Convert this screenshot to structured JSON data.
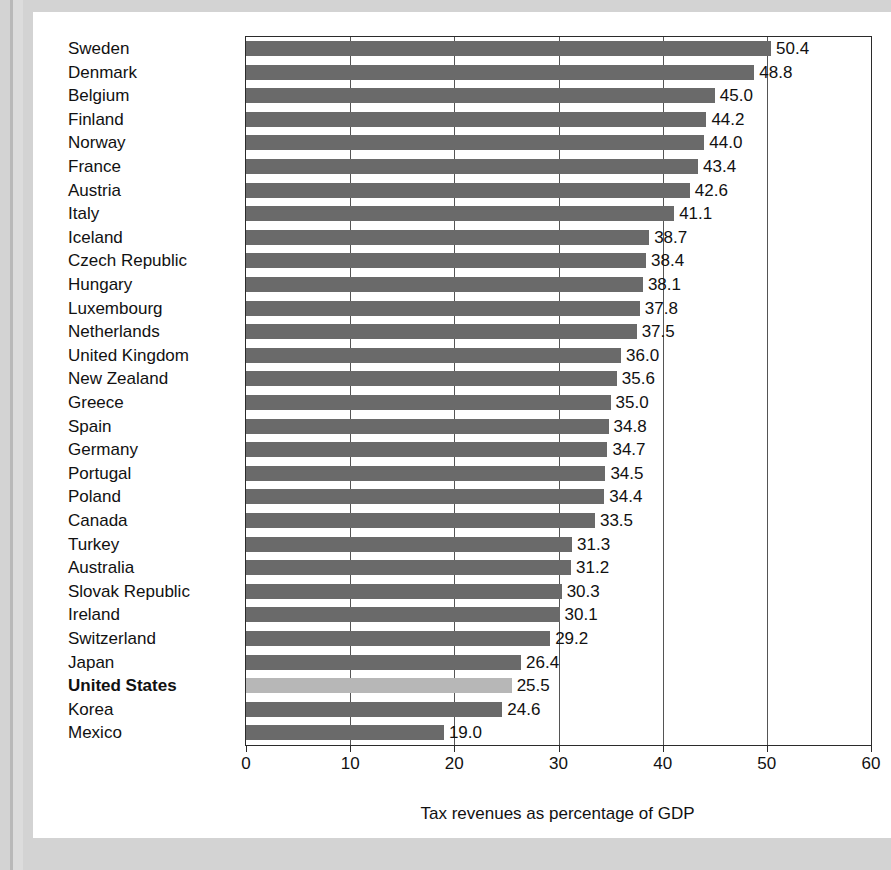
{
  "chart_data": {
    "type": "bar",
    "orientation": "horizontal",
    "title": "",
    "xlabel": "Tax revenues as percentage of GDP",
    "ylabel": "",
    "xlim": [
      0,
      60
    ],
    "xticks": [
      0,
      10,
      20,
      30,
      40,
      50,
      60
    ],
    "xtick_labels": [
      "0",
      "10",
      "20",
      "30",
      "40",
      "50",
      "60"
    ],
    "grid": "vertical",
    "legend": "none",
    "highlight_category": "United States",
    "colors": {
      "bar": "#6a6a6a",
      "bar_highlight": "#b7b7b7",
      "axis": "#2b2b2b",
      "gridline": "#555555",
      "text": "#111111",
      "card_background": "#ffffff",
      "page_background": "#d3d3d3"
    },
    "categories": [
      "Sweden",
      "Denmark",
      "Belgium",
      "Finland",
      "Norway",
      "France",
      "Austria",
      "Italy",
      "Iceland",
      "Czech Republic",
      "Hungary",
      "Luxembourg",
      "Netherlands",
      "United Kingdom",
      "New Zealand",
      "Greece",
      "Spain",
      "Germany",
      "Portugal",
      "Poland",
      "Canada",
      "Turkey",
      "Australia",
      "Slovak Republic",
      "Ireland",
      "Switzerland",
      "Japan",
      "United States",
      "Korea",
      "Mexico"
    ],
    "values": [
      50.4,
      48.8,
      45.0,
      44.2,
      44.0,
      43.4,
      42.6,
      41.1,
      38.7,
      38.4,
      38.1,
      37.8,
      37.5,
      36.0,
      35.6,
      35.0,
      34.8,
      34.7,
      34.5,
      34.4,
      33.5,
      31.3,
      31.2,
      30.3,
      30.1,
      29.2,
      26.4,
      25.5,
      24.6,
      19.0
    ],
    "value_labels": [
      "50.4",
      "48.8",
      "45.0",
      "44.2",
      "44.0",
      "43.4",
      "42.6",
      "41.1",
      "38.7",
      "38.4",
      "38.1",
      "37.8",
      "37.5",
      "36.0",
      "35.6",
      "35.0",
      "34.8",
      "34.7",
      "34.5",
      "34.4",
      "33.5",
      "31.3",
      "31.2",
      "30.3",
      "30.1",
      "29.2",
      "26.4",
      "25.5",
      "24.6",
      "19.0"
    ]
  }
}
